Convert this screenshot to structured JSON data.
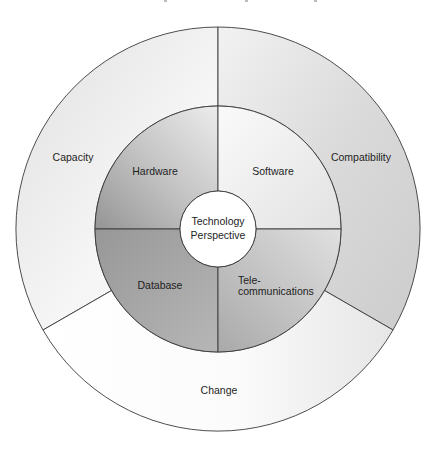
{
  "diagram": {
    "title_cut_off": true,
    "center": {
      "label_line1": "Technology",
      "label_line2": "Perspective",
      "fill": "#ffffff"
    },
    "inner_ring": {
      "segments": [
        {
          "label": "Hardware",
          "position": "top-left",
          "fill_light": "#e6e6e6",
          "fill_dark": "#9c9c9c"
        },
        {
          "label": "Software",
          "position": "top-right",
          "fill_light": "#f7f7f7",
          "fill_dark": "#e4e4e4"
        },
        {
          "label": "Database",
          "position": "bottom-left",
          "fill_light": "#b4b4b4",
          "fill_dark": "#989898"
        },
        {
          "label_line1": "Tele-",
          "label_line2": "communications",
          "position": "bottom-right",
          "fill_light": "#dcdcdc",
          "fill_dark": "#aeaeae"
        }
      ]
    },
    "outer_ring": {
      "segments": [
        {
          "label": "Capacity",
          "position": "left",
          "fill_light": "#f8f8f8",
          "fill_dark": "#e2e2e2"
        },
        {
          "label": "Compatibility",
          "position": "right",
          "fill_light": "#e6e6e6",
          "fill_dark": "#cfcfcf"
        },
        {
          "label": "Change",
          "position": "bottom",
          "fill_light": "#ffffff",
          "fill_dark": "#ebebeb"
        }
      ]
    },
    "stroke_color": "#3a3a3a"
  }
}
